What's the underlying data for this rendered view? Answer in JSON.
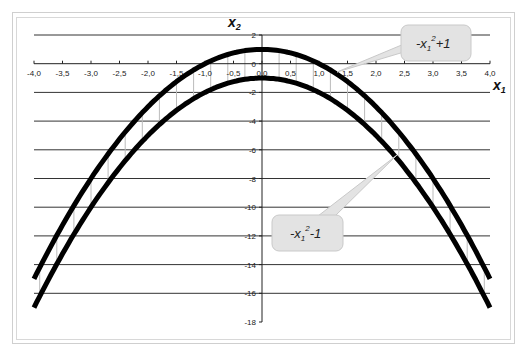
{
  "chart_data": {
    "type": "line",
    "title": "",
    "xlabel": "x1",
    "ylabel": "x2",
    "xlim": [
      -4.0,
      4.0
    ],
    "ylim": [
      -18,
      2
    ],
    "grid": {
      "horizontal": true,
      "vertical": false
    },
    "x_ticks": [
      -4.0,
      -3.5,
      -3.0,
      -2.5,
      -2.0,
      -1.5,
      -1.0,
      -0.5,
      0.0,
      0.5,
      1.0,
      1.5,
      2.0,
      2.5,
      3.0,
      3.5,
      4.0
    ],
    "x_tick_labels": [
      "-4,0",
      "-3,5",
      "-3,0",
      "-2,5",
      "-2,0",
      "-1,5",
      "-1,0",
      "-0,5",
      "0,0",
      "0,5",
      "1,0",
      "1,5",
      "2,0",
      "2,5",
      "3,0",
      "3,5",
      "4,0"
    ],
    "y_ticks": [
      2,
      0,
      -2,
      -4,
      -6,
      -8,
      -10,
      -12,
      -14,
      -16,
      -18
    ],
    "y_tick_labels": [
      "2",
      "0",
      "-2",
      "-4",
      "-6",
      "-8",
      "-10",
      "-12",
      "-14",
      "-16",
      "-18"
    ],
    "series": [
      {
        "name": "-x1^2+1",
        "formula": "-x^2+1",
        "x": [
          -4.0,
          -3.5,
          -3.0,
          -2.5,
          -2.0,
          -1.5,
          -1.0,
          -0.5,
          0.0,
          0.5,
          1.0,
          1.5,
          2.0,
          2.5,
          3.0,
          3.5,
          4.0
        ],
        "values": [
          -15,
          -11.25,
          -8,
          -5.25,
          -3,
          -1.25,
          0,
          0.75,
          1,
          0.75,
          0,
          -1.25,
          -3,
          -5.25,
          -8,
          -11.25,
          -15
        ],
        "color": "#000000"
      },
      {
        "name": "-x1^2-1",
        "formula": "-x^2-1",
        "x": [
          -4.0,
          -3.5,
          -3.0,
          -2.5,
          -2.0,
          -1.5,
          -1.0,
          -0.5,
          0.0,
          0.5,
          1.0,
          1.5,
          2.0,
          2.5,
          3.0,
          3.5,
          4.0
        ],
        "values": [
          -17,
          -13.25,
          -10,
          -7.25,
          -5,
          -3.25,
          -2,
          -1.25,
          -1,
          -1.25,
          -2,
          -3.25,
          -5,
          -7.25,
          -10,
          -13.25,
          -17
        ],
        "color": "#000000"
      }
    ],
    "drop_lines": {
      "x_step": 0.3,
      "color": "#bbbbbb"
    },
    "annotations": [
      {
        "text": "-x",
        "sub": "1",
        "sup": "2",
        "tail": "+1",
        "points_to": [
          1.3,
          -0.69
        ]
      },
      {
        "text": "-x",
        "sub": "1",
        "sup": "2",
        "tail": "-1",
        "points_to": [
          2.3,
          -6.29
        ]
      }
    ]
  },
  "labels": {
    "y_axis": {
      "main": "x",
      "sub": "2"
    },
    "x_axis": {
      "main": "x",
      "sub": "1"
    },
    "callout_top": {
      "main": "-x",
      "sub": "1",
      "sup": "2",
      "tail": "+1"
    },
    "callout_bottom": {
      "main": "-x",
      "sub": "1",
      "sup": "2",
      "tail": "-1"
    }
  },
  "colors": {
    "curve": "#000000",
    "gridline": "#333333",
    "drop_line": "#bbbbbb",
    "callout_fill": "#e3e3e3",
    "callout_border": "#c9c9c9",
    "frame": "#d0d0d0"
  }
}
